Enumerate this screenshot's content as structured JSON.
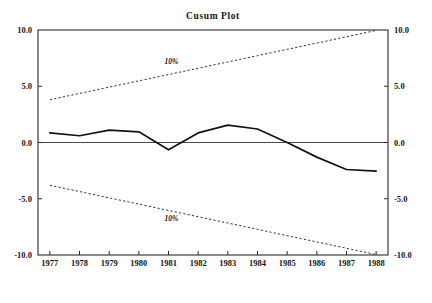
{
  "chart_data": {
    "type": "line",
    "title": "Cusum Plot",
    "xlabel": "",
    "ylabel": "",
    "xlim": [
      1976.6,
      1988.4
    ],
    "ylim": [
      -10.0,
      10.0
    ],
    "grid": false,
    "legend": "none",
    "x_tick_labels": [
      "1977",
      "1978",
      "1979",
      "1980",
      "1981",
      "1982",
      "1983",
      "1984",
      "1985",
      "1986",
      "1987",
      "1988"
    ],
    "y_tick_labels_left": [
      "10.0",
      "5.0",
      "0.0",
      "-5.0",
      "-10.0"
    ],
    "y_tick_labels_right": [
      "10.0",
      "5.0",
      "0.0",
      "-5.0",
      "-10.0"
    ],
    "y_ticks": [
      10.0,
      5.0,
      0.0,
      -5.0,
      -10.0
    ],
    "x": [
      1977,
      1978,
      1979,
      1980,
      1981,
      1982,
      1983,
      1984,
      1985,
      1986,
      1987,
      1988
    ],
    "series": [
      {
        "name": "cusum",
        "style": "solid",
        "values": [
          0.85,
          0.6,
          1.1,
          0.95,
          -0.65,
          0.85,
          1.55,
          1.2,
          0.0,
          -1.3,
          -2.4,
          -2.55
        ]
      },
      {
        "name": "upper-10pct-boundary",
        "style": "dotted",
        "values": [
          3.8,
          4.36,
          4.92,
          5.48,
          6.04,
          6.6,
          7.16,
          7.72,
          8.28,
          8.84,
          9.4,
          9.96
        ]
      },
      {
        "name": "lower-10pct-boundary",
        "style": "dotted",
        "values": [
          -3.8,
          -4.36,
          -4.92,
          -5.48,
          -6.04,
          -6.6,
          -7.16,
          -7.72,
          -8.28,
          -8.84,
          -9.4,
          -9.96
        ]
      }
    ],
    "annotations": [
      {
        "text": "10%",
        "x": 1981.1,
        "y": 7.0,
        "target": "upper-10pct-boundary"
      },
      {
        "text": "10%",
        "x": 1981.1,
        "y": -7.0,
        "target": "lower-10pct-boundary"
      }
    ]
  }
}
